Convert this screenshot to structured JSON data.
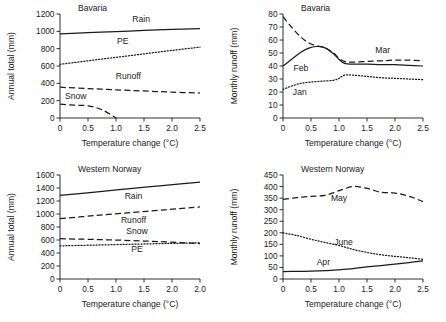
{
  "figure": {
    "panels": [
      {
        "id": "bavaria-annual",
        "title": "Bavaria",
        "xlabel": "Temperature change (°C)",
        "ylabel": "Annual total (mm)",
        "chart_data": {
          "type": "line",
          "title": "Bavaria",
          "xlabel": "Temperature change (°C)",
          "ylabel": "Annual total (mm)",
          "xlim": [
            0,
            2.5
          ],
          "ylim": [
            0,
            1200
          ],
          "xticks": [
            "0",
            "0.5",
            "1.0",
            "1.5",
            "2.0",
            "2.5"
          ],
          "xtickvals": [
            0,
            0.5,
            1.0,
            1.5,
            2.0,
            2.5
          ],
          "yticks": [
            "0",
            "200",
            "400",
            "600",
            "800",
            "1000",
            "1200"
          ],
          "ytickvals": [
            0,
            200,
            400,
            600,
            800,
            1000,
            1200
          ],
          "grid": false,
          "legend": "inline-labels",
          "series": [
            {
              "name": "Rain",
              "style": "solid",
              "label_x": 1.45,
              "label_y": 1105,
              "x": [
                0,
                0.5,
                1.0,
                1.5,
                2.0,
                2.5
              ],
              "values": [
                970,
                985,
                998,
                1010,
                1022,
                1032
              ]
            },
            {
              "name": "PE",
              "style": "dotted",
              "label_x": 1.12,
              "label_y": 855,
              "x": [
                0,
                0.5,
                1.0,
                1.5,
                2.0,
                2.5
              ],
              "values": [
                620,
                660,
                700,
                740,
                780,
                818
              ]
            },
            {
              "name": "Runoff",
              "style": "dashed",
              "label_x": 1.22,
              "label_y": 452,
              "x": [
                0,
                0.5,
                1.0,
                1.5,
                2.0,
                2.5
              ],
              "values": [
                355,
                340,
                325,
                312,
                298,
                288
              ]
            },
            {
              "name": "Snow",
              "style": "dashed",
              "label_x": 0.28,
              "label_y": 215,
              "x": [
                0,
                0.25,
                0.5,
                0.75,
                1.0
              ],
              "values": [
                160,
                148,
                140,
                95,
                0
              ]
            }
          ]
        }
      },
      {
        "id": "bavaria-monthly",
        "title": "Bavaria",
        "xlabel": "Temperature change (°C)",
        "ylabel": "Monthly runoff (mm)",
        "chart_data": {
          "type": "line",
          "title": "Bavaria",
          "xlabel": "Temperature change (°C)",
          "ylabel": "Monthly runoff (mm)",
          "xlim": [
            0,
            2.5
          ],
          "ylim": [
            0,
            80
          ],
          "xticks": [
            "0",
            "0.5",
            "1.0",
            "1.5",
            "2.0",
            "2.5"
          ],
          "xtickvals": [
            0,
            0.5,
            1.0,
            1.5,
            2.0,
            2.5
          ],
          "yticks": [
            "0",
            "10",
            "20",
            "30",
            "40",
            "50",
            "60",
            "70",
            "80"
          ],
          "ytickvals": [
            0,
            10,
            20,
            30,
            40,
            50,
            60,
            70,
            80
          ],
          "grid": false,
          "legend": "inline-labels",
          "series": [
            {
              "name": "Mar",
              "style": "dashed",
              "label_x": 1.78,
              "label_y": 50,
              "x": [
                0,
                0.15,
                0.3,
                0.45,
                0.6,
                0.75,
                0.9,
                1.0,
                1.1,
                1.25,
                1.5,
                1.75,
                2.0,
                2.25,
                2.5
              ],
              "values": [
                78,
                70,
                63,
                58,
                55.5,
                54,
                50,
                46,
                43.5,
                43,
                43.5,
                44,
                44.5,
                44.5,
                44
              ]
            },
            {
              "name": "Feb",
              "style": "solid",
              "label_x": 0.32,
              "label_y": 36,
              "x": [
                0,
                0.15,
                0.3,
                0.45,
                0.6,
                0.75,
                0.9,
                1.0,
                1.1,
                1.25,
                1.5,
                1.75,
                2.0,
                2.25,
                2.5
              ],
              "values": [
                40,
                45,
                50,
                53.5,
                55,
                54,
                49.5,
                45,
                42,
                41.5,
                41.5,
                41,
                41,
                40.5,
                40
              ]
            },
            {
              "name": "Jan",
              "style": "dotted",
              "label_x": 0.3,
              "label_y": 17.5,
              "x": [
                0,
                0.15,
                0.3,
                0.45,
                0.6,
                0.75,
                0.9,
                1.0,
                1.1,
                1.25,
                1.5,
                1.75,
                2.0,
                2.25,
                2.5
              ],
              "values": [
                22,
                24.5,
                26.5,
                27.5,
                28,
                28.5,
                29,
                30.5,
                33,
                33,
                32,
                31,
                30.5,
                30,
                29.5
              ]
            }
          ]
        }
      },
      {
        "id": "western-norway-annual",
        "title": "Western Norway",
        "xlabel": "Temperature change (°C)",
        "ylabel": "Annual total (mm)",
        "chart_data": {
          "type": "line",
          "title": "Western Norway",
          "xlabel": "Temperature change (°C)",
          "ylabel": "Annual total (mm)",
          "xlim": [
            0,
            2.0
          ],
          "ylim": [
            0,
            1600
          ],
          "xticks": [
            "0",
            "0.5",
            "1.0",
            "1.5",
            "2.0",
            "2.0"
          ],
          "xtickvals": [
            0,
            0.4,
            0.8,
            1.2,
            1.6,
            2.0
          ],
          "yticks": [
            "0",
            "200",
            "400",
            "600",
            "800",
            "1000",
            "1200",
            "1400",
            "1600"
          ],
          "ytickvals": [
            0,
            200,
            400,
            600,
            800,
            1000,
            1200,
            1400,
            1600
          ],
          "grid": false,
          "legend": "inline-labels",
          "series": [
            {
              "name": "Rain",
              "style": "solid",
              "label_x": 1.05,
              "label_y": 1235,
              "x": [
                0,
                0.5,
                1.0,
                1.5,
                2.0
              ],
              "values": [
                1285,
                1338,
                1390,
                1440,
                1492
              ]
            },
            {
              "name": "Runoff",
              "style": "dashed",
              "label_x": 1.05,
              "label_y": 855,
              "x": [
                0,
                0.5,
                1.0,
                1.5,
                2.0
              ],
              "values": [
                930,
                975,
                1020,
                1065,
                1110
              ]
            },
            {
              "name": "Snow",
              "style": "dashed",
              "label_x": 1.1,
              "label_y": 690,
              "x": [
                0,
                0.5,
                1.0,
                1.5,
                2.0
              ],
              "values": [
                620,
                608,
                592,
                572,
                545
              ]
            },
            {
              "name": "PE",
              "style": "dotted",
              "label_x": 1.1,
              "label_y": 420,
              "x": [
                0,
                0.5,
                1.0,
                1.5,
                2.0
              ],
              "values": [
                510,
                522,
                534,
                546,
                556
              ]
            }
          ]
        }
      },
      {
        "id": "western-norway-monthly",
        "title": "Western Norway",
        "xlabel": "Temperature change (°C)",
        "ylabel": "Monthly runoff (mm)",
        "chart_data": {
          "type": "line",
          "title": "Western Norway",
          "xlabel": "Temperature change (°C)",
          "ylabel": "Monthly runoff (mm)",
          "xlim": [
            0,
            2.5
          ],
          "ylim": [
            0,
            450
          ],
          "xticks": [
            "0",
            "0.5",
            "1.0",
            "1.5",
            "2.0",
            "2.5"
          ],
          "xtickvals": [
            0,
            0.5,
            1.0,
            1.5,
            2.0,
            2.5
          ],
          "yticks": [
            "0",
            "50",
            "100",
            "150",
            "200",
            "250",
            "300",
            "350",
            "400",
            "450"
          ],
          "ytickvals": [
            0,
            50,
            100,
            150,
            200,
            250,
            300,
            350,
            400,
            450
          ],
          "grid": false,
          "legend": "inline-labels",
          "series": [
            {
              "name": "May",
              "style": "dashed",
              "label_x": 1.0,
              "label_y": 338,
              "x": [
                0,
                0.25,
                0.5,
                0.75,
                1.0,
                1.25,
                1.5,
                1.75,
                2.0,
                2.25,
                2.5
              ],
              "values": [
                345,
                352,
                358,
                362,
                382,
                400,
                392,
                375,
                372,
                358,
                335
              ]
            },
            {
              "name": "June",
              "style": "dotted",
              "label_x": 1.08,
              "label_y": 148,
              "x": [
                0,
                0.25,
                0.5,
                0.75,
                1.0,
                1.25,
                1.5,
                1.75,
                2.0,
                2.25,
                2.5
              ],
              "values": [
                200,
                188,
                172,
                158,
                145,
                128,
                115,
                105,
                98,
                92,
                85
              ]
            },
            {
              "name": "Apr",
              "style": "solid",
              "label_x": 0.72,
              "label_y": 62,
              "x": [
                0,
                0.25,
                0.5,
                0.75,
                1.0,
                1.25,
                1.5,
                1.75,
                2.0,
                2.25,
                2.5
              ],
              "values": [
                32,
                33,
                34,
                36,
                40,
                45,
                52,
                58,
                64,
                71,
                78
              ]
            }
          ]
        }
      }
    ]
  }
}
